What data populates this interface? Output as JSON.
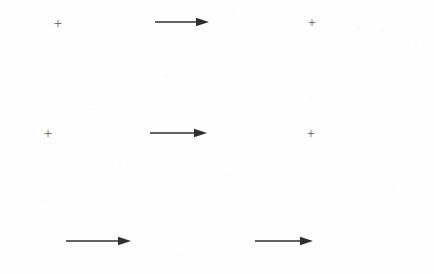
{
  "figure": {
    "type": "scanned-diagram",
    "background_color": "#fefefe",
    "ink_color": "#2f2f2f",
    "plus_color": "#555555",
    "width": 434,
    "height": 274,
    "caption": ""
  },
  "marks": {
    "plus_symbol": "+",
    "arrow_symbol": "→"
  },
  "plus_marks": [
    {
      "name": "plus-top-left",
      "label": "+",
      "x": 58,
      "y": 23,
      "size": 15
    },
    {
      "name": "plus-top-right",
      "label": "+",
      "x": 312,
      "y": 23,
      "size": 14
    },
    {
      "name": "plus-middle-left",
      "label": "+",
      "x": 48,
      "y": 133,
      "size": 15
    },
    {
      "name": "plus-middle-right",
      "label": "+",
      "x": 311,
      "y": 134,
      "size": 14
    }
  ],
  "arrows": [
    {
      "name": "arrow-top-center",
      "direction": "right",
      "x1": 155,
      "x2": 209,
      "y": 22,
      "length": 54,
      "stroke": 1.5
    },
    {
      "name": "arrow-middle-center",
      "direction": "right",
      "x1": 150,
      "x2": 207,
      "y": 133,
      "length": 57,
      "stroke": 1.5
    },
    {
      "name": "arrow-bottom-left",
      "direction": "right",
      "x1": 66,
      "x2": 131,
      "y": 241,
      "length": 65,
      "stroke": 1.5
    },
    {
      "name": "arrow-bottom-right",
      "direction": "right",
      "x1": 255,
      "x2": 313,
      "y": 241,
      "length": 58,
      "stroke": 1.5
    }
  ],
  "speckles": [
    {
      "x": 233,
      "y": 12,
      "w": 2,
      "h": 2,
      "o": 0.05
    },
    {
      "x": 357,
      "y": 27,
      "w": 2,
      "h": 3,
      "o": 0.05
    },
    {
      "x": 381,
      "y": 30,
      "w": 2,
      "h": 2,
      "o": 0.04
    },
    {
      "x": 415,
      "y": 42,
      "w": 2,
      "h": 2,
      "o": 0.04
    },
    {
      "x": 92,
      "y": 55,
      "w": 2,
      "h": 2,
      "o": 0.04
    },
    {
      "x": 143,
      "y": 47,
      "w": 2,
      "h": 2,
      "o": 0.04
    },
    {
      "x": 215,
      "y": 61,
      "w": 2,
      "h": 2,
      "o": 0.03
    },
    {
      "x": 249,
      "y": 55,
      "w": 2,
      "h": 3,
      "o": 0.04
    },
    {
      "x": 166,
      "y": 75,
      "w": 2,
      "h": 2,
      "o": 0.03
    },
    {
      "x": 90,
      "y": 108,
      "w": 2,
      "h": 2,
      "o": 0.04
    },
    {
      "x": 310,
      "y": 96,
      "w": 2,
      "h": 2,
      "o": 0.03
    },
    {
      "x": 119,
      "y": 164,
      "w": 2,
      "h": 2,
      "o": 0.04
    },
    {
      "x": 228,
      "y": 173,
      "w": 2,
      "h": 2,
      "o": 0.03
    },
    {
      "x": 44,
      "y": 201,
      "w": 2,
      "h": 2,
      "o": 0.04
    },
    {
      "x": 332,
      "y": 227,
      "w": 2,
      "h": 2,
      "o": 0.04
    },
    {
      "x": 392,
      "y": 188,
      "w": 2,
      "h": 2,
      "o": 0.03
    },
    {
      "x": 178,
      "y": 253,
      "w": 2,
      "h": 2,
      "o": 0.03
    },
    {
      "x": 289,
      "y": 262,
      "w": 2,
      "h": 2,
      "o": 0.03
    }
  ]
}
